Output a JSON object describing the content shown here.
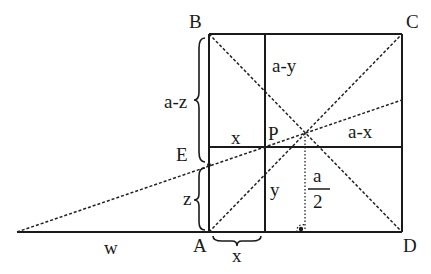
{
  "diagram": {
    "type": "geometry-square-construction",
    "vertices": {
      "B": {
        "label": "B"
      },
      "C": {
        "label": "C"
      },
      "D": {
        "label": "D"
      },
      "A": {
        "label": "A"
      },
      "E": {
        "label": "E"
      },
      "P": {
        "label": "P"
      }
    },
    "segment_labels": {
      "a_minus_z": "a-z",
      "z": "z",
      "x_top": "x",
      "a_minus_y": "a-y",
      "a_minus_x": "a-x",
      "y": "y",
      "a_over_2_num": "a",
      "a_over_2_den": "2",
      "w": "w",
      "x_bottom": "x"
    },
    "colors": {
      "ink": "#1a1a1a",
      "background": "#ffffff"
    }
  }
}
